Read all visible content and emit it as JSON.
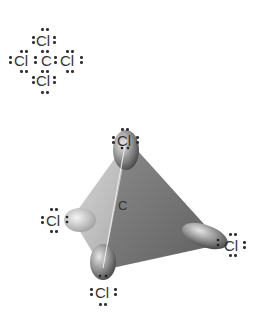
{
  "lewis_structure": {
    "central_atom": "C",
    "top": "Cl",
    "left": "Cl",
    "right": "Cl",
    "bottom": "Cl"
  },
  "tetrahedral_model": {
    "central_atom": "C",
    "top": "Cl",
    "left": "Cl",
    "right": "Cl",
    "bottom": "Cl"
  },
  "colors": {
    "face_dark": "#6e6e6e",
    "face_light": "#bdbdbd",
    "text": "#333333"
  }
}
